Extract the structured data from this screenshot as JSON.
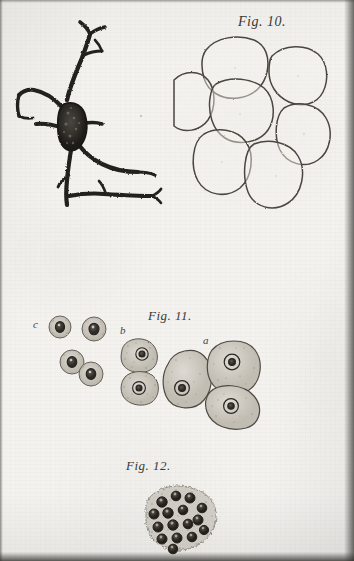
{
  "plate": {
    "medium": "engraved-histological-plate",
    "paper_color": "#f3f2ef",
    "ink_color": "#3b3833",
    "width": 354,
    "height": 561
  },
  "figures": [
    {
      "id": "fig-10",
      "caption": "Fig. 10.",
      "subject": "multipolar-nerve-cell-and-polygonal-cell-group",
      "elements": [
        {
          "name": "multipolar-nerve-cell",
          "description": "dark branching neuron with granular soma and radiating processes",
          "soma": {
            "cx": 64,
            "cy": 112,
            "rx": 11,
            "ry": 19
          },
          "processes": 6
        },
        {
          "name": "polygonal-cell-group",
          "description": "seven large polygonal cells with thin outlines",
          "cell_count": 7
        }
      ]
    },
    {
      "id": "fig-11",
      "caption": "Fig. 11.",
      "subject": "granular-cells-three-stages",
      "part_labels": [
        "a",
        "b",
        "c"
      ],
      "groups": [
        {
          "label": "a",
          "cell_count": 3,
          "description": "large irregular polygonal cells with prominent nuclei and nucleoli"
        },
        {
          "label": "b",
          "cell_count": 2,
          "description": "two stacked rounded granular cells with nuclei"
        },
        {
          "label": "c",
          "cell_count": 4,
          "description": "small granular cells with dark nuclei"
        }
      ]
    },
    {
      "id": "fig-12",
      "caption": "Fig. 12.",
      "subject": "dense-cell-cluster",
      "cell_count": 16,
      "description": "rounded mass of small dark-nucleated cells in granular matrix"
    }
  ]
}
